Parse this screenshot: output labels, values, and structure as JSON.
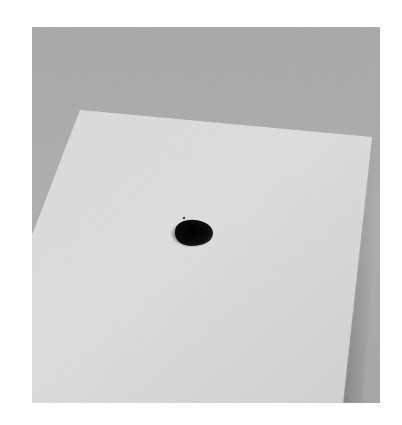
{
  "image": {
    "alt": "A single drop of dark ink on a sheet of white paper lying on a gray textured surface",
    "subject": "ink drop on paper",
    "colors": {
      "page_background": "#ffffff",
      "surface": "#a9a9a9",
      "surface_light": "#b4b4b4",
      "paper": "#d6d6d6",
      "paper_light": "#dedede",
      "paper_shadow": "#8f8f8f",
      "ink": "#0a0a0a"
    }
  }
}
